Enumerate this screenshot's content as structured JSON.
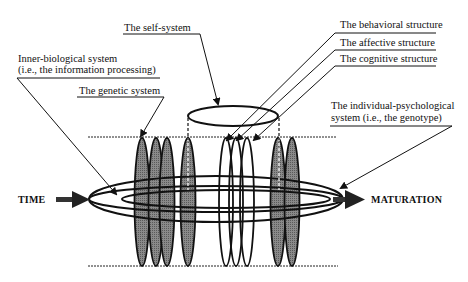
{
  "diagram": {
    "type": "conceptual-model",
    "labels": {
      "self_system": "The self-system",
      "inner_biological_line1": "Inner-biological system",
      "inner_biological_line2": "(i.e., the information processing)",
      "genetic_system": "The genetic system",
      "behavioral_structure": "The behavioral structure",
      "affective_structure": "The affective structure",
      "cognitive_structure": "The cognitive structure",
      "individual_psych_line1": "The individual-psychological",
      "individual_psych_line2": "system (i.e., the genotype)",
      "time": "TIME",
      "maturation": "MATURATION"
    },
    "colors": {
      "ink": "#111111",
      "gray_fill": "#7a7a7a",
      "background": "#ffffff"
    }
  }
}
